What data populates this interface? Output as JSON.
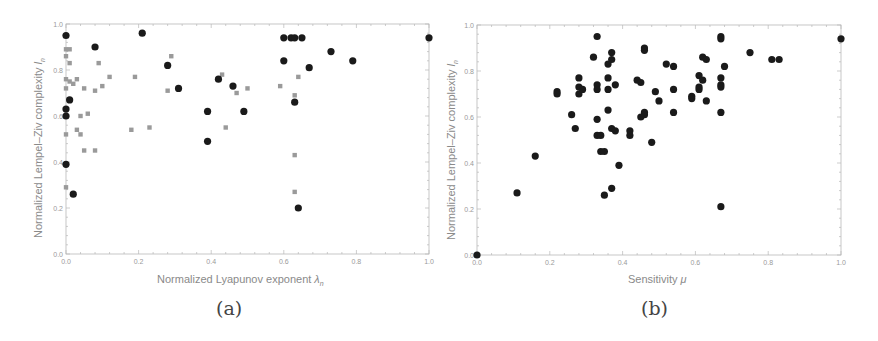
{
  "figure": {
    "panel_a": {
      "caption": "(a)"
    },
    "panel_b": {
      "caption": "(b)"
    }
  },
  "chart_data": [
    {
      "type": "scatter",
      "panel": "(a)",
      "title": "",
      "xlabel": "Normalized Lyapunov exponent λn",
      "xlabel_main": "Normalized Lyapunov exponent ",
      "xlabel_symbol": "λ",
      "xlabel_sub": "n",
      "ylabel": "Normalized Lempel–Ziv complexity ln",
      "ylabel_main": "Normalized Lempel–Ziv complexity ",
      "ylabel_symbol": "l",
      "ylabel_sub": "n",
      "xlim": [
        0.0,
        1.0
      ],
      "ylim": [
        0.0,
        1.0
      ],
      "xticks": [
        "0.0",
        "0.2",
        "0.4",
        "0.6",
        "0.8",
        "1.0"
      ],
      "yticks": [
        "0.0",
        "0.2",
        "0.4",
        "0.6",
        "0.8",
        "1.0"
      ],
      "grid": false,
      "legend": "none",
      "series": [
        {
          "name": "black circles",
          "marker": "circle",
          "color": "#1a1a1a",
          "points": [
            [
              0.0,
              0.95
            ],
            [
              0.21,
              0.96
            ],
            [
              0.08,
              0.9
            ],
            [
              0.6,
              0.94
            ],
            [
              0.62,
              0.94
            ],
            [
              0.63,
              0.94
            ],
            [
              0.65,
              0.94
            ],
            [
              1.0,
              0.94
            ],
            [
              0.73,
              0.88
            ],
            [
              0.6,
              0.84
            ],
            [
              0.79,
              0.84
            ],
            [
              0.28,
              0.82
            ],
            [
              0.67,
              0.81
            ],
            [
              0.42,
              0.76
            ],
            [
              0.46,
              0.73
            ],
            [
              0.31,
              0.72
            ],
            [
              0.01,
              0.67
            ],
            [
              0.63,
              0.66
            ],
            [
              0.39,
              0.62
            ],
            [
              0.49,
              0.62
            ],
            [
              0.0,
              0.63
            ],
            [
              0.0,
              0.6
            ],
            [
              0.39,
              0.49
            ],
            [
              0.0,
              0.39
            ],
            [
              0.02,
              0.26
            ],
            [
              0.64,
              0.2
            ]
          ]
        },
        {
          "name": "gray squares",
          "marker": "square",
          "color": "#9a9a9a",
          "points": [
            [
              0.0,
              0.89
            ],
            [
              0.01,
              0.89
            ],
            [
              0.0,
              0.86
            ],
            [
              0.01,
              0.83
            ],
            [
              0.09,
              0.83
            ],
            [
              0.29,
              0.86
            ],
            [
              0.43,
              0.78
            ],
            [
              0.0,
              0.76
            ],
            [
              0.01,
              0.75
            ],
            [
              0.02,
              0.74
            ],
            [
              0.03,
              0.76
            ],
            [
              0.12,
              0.77
            ],
            [
              0.19,
              0.77
            ],
            [
              0.64,
              0.77
            ],
            [
              0.0,
              0.72
            ],
            [
              0.05,
              0.72
            ],
            [
              0.08,
              0.71
            ],
            [
              0.1,
              0.73
            ],
            [
              0.28,
              0.71
            ],
            [
              0.47,
              0.7
            ],
            [
              0.5,
              0.72
            ],
            [
              0.59,
              0.73
            ],
            [
              0.63,
              0.69
            ],
            [
              0.04,
              0.6
            ],
            [
              0.06,
              0.61
            ],
            [
              0.03,
              0.54
            ],
            [
              0.04,
              0.52
            ],
            [
              0.18,
              0.54
            ],
            [
              0.23,
              0.55
            ],
            [
              0.44,
              0.55
            ],
            [
              0.0,
              0.52
            ],
            [
              0.05,
              0.45
            ],
            [
              0.08,
              0.45
            ],
            [
              0.63,
              0.43
            ],
            [
              0.0,
              0.29
            ],
            [
              0.63,
              0.27
            ]
          ]
        }
      ]
    },
    {
      "type": "scatter",
      "panel": "(b)",
      "title": "",
      "xlabel": "Sensitivity μ",
      "xlabel_main": "Sensitivity ",
      "xlabel_symbol": "μ",
      "ylabel": "Normalized Lempel–Ziv complexity ln",
      "ylabel_main": "Normalized Lempel–Ziv complexity ",
      "ylabel_symbol": "l",
      "ylabel_sub": "n",
      "xlim": [
        0.0,
        1.0
      ],
      "ylim": [
        0.0,
        1.0
      ],
      "xticks": [
        "0.0",
        "0.2",
        "0.4",
        "0.6",
        "0.8",
        "1.0"
      ],
      "yticks": [
        "0.0",
        "0.2",
        "0.4",
        "0.6",
        "0.8",
        "1.0"
      ],
      "grid": false,
      "legend": "none",
      "series": [
        {
          "name": "black circles",
          "marker": "circle",
          "color": "#1a1a1a",
          "points": [
            [
              0.33,
              0.95
            ],
            [
              0.67,
              0.95
            ],
            [
              0.67,
              0.94
            ],
            [
              1.0,
              0.94
            ],
            [
              0.46,
              0.9
            ],
            [
              0.46,
              0.89
            ],
            [
              0.75,
              0.88
            ],
            [
              0.37,
              0.88
            ],
            [
              0.32,
              0.86
            ],
            [
              0.37,
              0.85
            ],
            [
              0.36,
              0.83
            ],
            [
              0.62,
              0.86
            ],
            [
              0.63,
              0.85
            ],
            [
              0.52,
              0.83
            ],
            [
              0.54,
              0.82
            ],
            [
              0.68,
              0.82
            ],
            [
              0.81,
              0.85
            ],
            [
              0.83,
              0.85
            ],
            [
              0.28,
              0.77
            ],
            [
              0.36,
              0.77
            ],
            [
              0.44,
              0.76
            ],
            [
              0.45,
              0.75
            ],
            [
              0.61,
              0.78
            ],
            [
              0.62,
              0.76
            ],
            [
              0.67,
              0.77
            ],
            [
              0.22,
              0.71
            ],
            [
              0.22,
              0.7
            ],
            [
              0.28,
              0.73
            ],
            [
              0.28,
              0.7
            ],
            [
              0.29,
              0.72
            ],
            [
              0.33,
              0.74
            ],
            [
              0.33,
              0.72
            ],
            [
              0.36,
              0.72
            ],
            [
              0.38,
              0.74
            ],
            [
              0.49,
              0.71
            ],
            [
              0.54,
              0.72
            ],
            [
              0.61,
              0.72
            ],
            [
              0.61,
              0.73
            ],
            [
              0.67,
              0.74
            ],
            [
              0.67,
              0.73
            ],
            [
              0.5,
              0.67
            ],
            [
              0.59,
              0.69
            ],
            [
              0.59,
              0.68
            ],
            [
              0.63,
              0.67
            ],
            [
              0.26,
              0.61
            ],
            [
              0.36,
              0.63
            ],
            [
              0.46,
              0.62
            ],
            [
              0.46,
              0.61
            ],
            [
              0.45,
              0.6
            ],
            [
              0.54,
              0.62
            ],
            [
              0.67,
              0.62
            ],
            [
              0.33,
              0.59
            ],
            [
              0.27,
              0.55
            ],
            [
              0.37,
              0.55
            ],
            [
              0.38,
              0.54
            ],
            [
              0.42,
              0.54
            ],
            [
              0.42,
              0.52
            ],
            [
              0.33,
              0.52
            ],
            [
              0.34,
              0.52
            ],
            [
              0.48,
              0.49
            ],
            [
              0.34,
              0.45
            ],
            [
              0.35,
              0.45
            ],
            [
              0.39,
              0.39
            ],
            [
              0.16,
              0.43
            ],
            [
              0.11,
              0.27
            ],
            [
              0.37,
              0.29
            ],
            [
              0.35,
              0.26
            ],
            [
              0.67,
              0.21
            ],
            [
              0.0,
              0.0
            ]
          ]
        }
      ]
    }
  ]
}
